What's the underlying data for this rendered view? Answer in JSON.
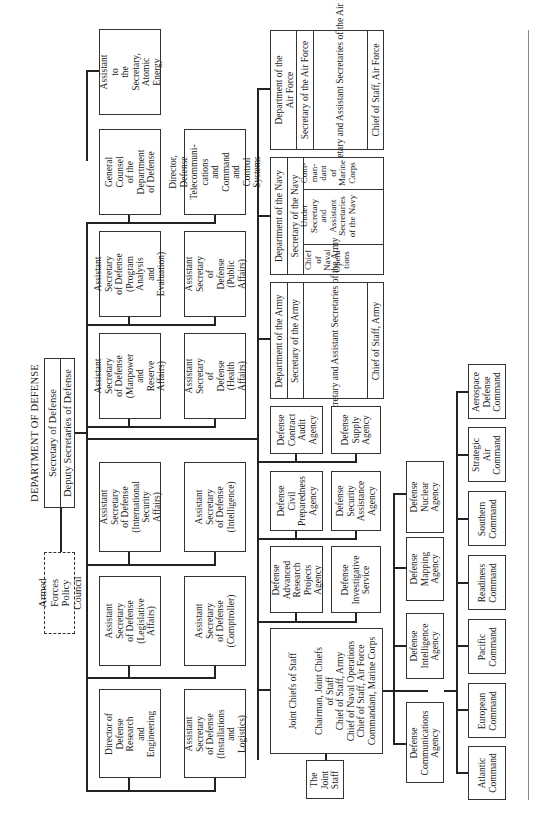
{
  "title": "DEPARTMENT OF DEFENSE",
  "secretary": {
    "secretary": "Secretary of Defense",
    "deputies": "Deputy Secretaries of Defense"
  },
  "policy_council": "Armed Forces\nPolicy Council",
  "osd_offices": [
    {
      "id": "atomic",
      "label": "Assistant to\nthe Secretary,\nAtomic Energy"
    },
    {
      "id": "general_counsel",
      "label": "General Counsel\nof the\nDepartment\nof Defense"
    },
    {
      "id": "telecom",
      "label": "Director,\nDefense\nTelecommuni-\ncations\nand Command and\nControl Systems"
    },
    {
      "id": "pa_e",
      "label": "Assistant\nSecretary\nof Defense\n(Program\nAnalysis\nand Evaluation)"
    },
    {
      "id": "public_affairs",
      "label": "Assistant\nSecretary\nof Defense\n(Public Affairs)"
    },
    {
      "id": "manpower",
      "label": "Assistant\nSecretary\nof Defense\n(Manpower and\nReserve Affairs)"
    },
    {
      "id": "health",
      "label": "Assistant\nSecretary\nof Defense\n(Health Affairs)"
    },
    {
      "id": "isa",
      "label": "Assistant\nSecretary\nof Defense\n(International\nSecurity Affairs)"
    },
    {
      "id": "intelligence",
      "label": "Assistant\nSecretary\nof Defense\n(Intelligence)"
    },
    {
      "id": "legislative",
      "label": "Assistant\nSecretary\nof Defense\n(Legislative Affairs)"
    },
    {
      "id": "comptroller",
      "label": "Assistant\nSecretary\nof Defense\n(Comptroller)"
    },
    {
      "id": "dre",
      "label": "Director of\nDefense Research\nand Engineering"
    },
    {
      "id": "installations",
      "label": "Assistant\nSecretary\nof Defense\n(Installations and\nLogistics)"
    }
  ],
  "military_departments": {
    "air_force": {
      "name": "Department of the\nAir Force",
      "secretary": "Secretary of the Air Force",
      "under": "Under Secretary\nand Assistant\nSecretaries of the Air Force",
      "chief": "Chief of Staff, Air Force"
    },
    "navy": {
      "name": "Department of the Navy",
      "secretary": "Secretary of the Navy",
      "commandant": "Com-\nman-\ndant\nof\nMarine\nCorps",
      "under": "Under\nSecretary\nand\nAssistant\nSecretaries\nof the Navy",
      "cno": "Chief\nof\nNaval\nOpera-\ntions"
    },
    "army": {
      "name": "Department of the Army",
      "secretary": "Secretary of the Army",
      "under": "Under Secretary\nand Assistant\nSecretaries of the Army",
      "chief": "Chief of Staff, Army"
    }
  },
  "agencies": [
    {
      "id": "dcaa",
      "label": "Defense\nContract\nAudit\nAgency"
    },
    {
      "id": "dsa",
      "label": "Defense\nSupply\nAgency"
    },
    {
      "id": "dcpa",
      "label": "Defense\nCivil\nPreparedness\nAgency"
    },
    {
      "id": "dsaa",
      "label": "Defense\nSecurity\nAssistance\nAgency"
    },
    {
      "id": "darpa",
      "label": "Defense\nAdvanced\nResearch\nProjects\nAgency"
    },
    {
      "id": "dis",
      "label": "Defense\nInvestigative\nService"
    },
    {
      "id": "dna",
      "label": "Defense\nNuclear\nAgency"
    },
    {
      "id": "dma",
      "label": "Defense\nMapping\nAgency"
    },
    {
      "id": "dia",
      "label": "Defense\nIntelligence\nAgency"
    },
    {
      "id": "dca",
      "label": "Defense\nCommunications\nAgency"
    }
  ],
  "jcs": {
    "title": "Joint Chiefs of Staff",
    "members": "Chairman, Joint Chiefs\nof Staff\nChief of Staff, Army\nChief of Naval Operations\nChief of Staff, Air Force\nCommandant, Marine Corps",
    "joint_staff": "The\nJoint\nStaff"
  },
  "commands": [
    {
      "id": "aerospace",
      "label": "Aerospace\nDefense\nCommand"
    },
    {
      "id": "sac",
      "label": "Strategic\nAir\nCommand"
    },
    {
      "id": "southern",
      "label": "Southern\nCommand"
    },
    {
      "id": "readiness",
      "label": "Readiness\nCommand"
    },
    {
      "id": "pacific",
      "label": "Pacific\nCommand"
    },
    {
      "id": "european",
      "label": "European\nCommand"
    },
    {
      "id": "atlantic",
      "label": "Atlantic\nCommand"
    }
  ]
}
